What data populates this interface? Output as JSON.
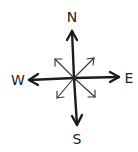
{
  "diagram": {
    "type": "compass-rose",
    "style": "hand-drawn",
    "colors": {
      "ink": "#1c1c1c",
      "background": "#ffffff"
    },
    "labels": {
      "north": "N",
      "east": "E",
      "south": "S",
      "west": "W"
    },
    "cardinal_arrows": [
      "north",
      "east",
      "south",
      "west"
    ],
    "intercardinal_arrows": [
      "northeast",
      "southeast",
      "southwest",
      "northwest"
    ]
  }
}
